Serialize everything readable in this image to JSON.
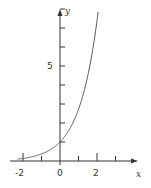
{
  "chart_data": {
    "type": "line",
    "title": "",
    "function": "y = e^x",
    "xlabel": "x",
    "ylabel": "y",
    "xlim": [
      -2.3,
      4.2
    ],
    "ylim": [
      0,
      8.5
    ],
    "x_ticks": [
      -2,
      -1,
      0,
      1,
      2,
      3
    ],
    "x_tick_labels": [
      "-2",
      "0",
      "2"
    ],
    "y_ticks": [
      1,
      2,
      3,
      4,
      5,
      6,
      7,
      8
    ],
    "y_tick_labels": [
      "5"
    ],
    "grid": false,
    "legend": null,
    "series": [
      {
        "name": "e^x",
        "x": [
          -2.3,
          -2,
          -1.5,
          -1,
          -0.5,
          0,
          0.5,
          1,
          1.5,
          2,
          2.07
        ],
        "y": [
          0.1,
          0.135,
          0.223,
          0.368,
          0.607,
          1.0,
          1.649,
          2.718,
          4.482,
          7.389,
          7.92
        ]
      }
    ],
    "colors": {
      "curve": "#555555",
      "axis": "#333333"
    }
  }
}
